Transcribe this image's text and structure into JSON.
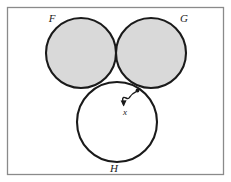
{
  "figure": {
    "background_color": "#ffffff",
    "frame": {
      "name": "diagram-frame",
      "x": 7.5,
      "y": 7.5,
      "width": 216,
      "height": 167,
      "stroke_color": "#8a8a8a",
      "stroke_width": 1.3,
      "fill": "#ffffff"
    },
    "shading": {
      "description": "Union of F and G, excluding H",
      "fill_color": "#d9d9d9"
    },
    "circle_stroke_color": "#1a1a1a",
    "circle_stroke_width": 2.1
  },
  "circles": [
    {
      "name": "circle-f",
      "label": "F",
      "cx": 81,
      "cy": 53,
      "r": 35,
      "shaded": true,
      "label_x": 52,
      "label_y": 22
    },
    {
      "name": "circle-g",
      "label": "G",
      "cx": 151,
      "cy": 53,
      "r": 35,
      "shaded": true,
      "label_x": 184,
      "label_y": 22
    },
    {
      "name": "circle-h",
      "label": "H",
      "cx": 117,
      "cy": 122,
      "r": 40,
      "shaded": false,
      "label_x": 114,
      "label_y": 172
    }
  ],
  "annotation": {
    "name": "element-x-annotation",
    "label": "x",
    "point": {
      "x": 137.5,
      "y": 90.5,
      "radius": 1.9
    },
    "label_position": {
      "x": 125,
      "y": 115
    },
    "arrow_tip": {
      "x": 123.5,
      "y": 105.5
    },
    "arrow_path": "M 136.2 91.6 C 127.5 95.5 131.0 100.5 126.0 98.0 C 121.5 95.8 122.5 100.0 123.6 105.0",
    "arrow_stroke_color": "#1a1a1a",
    "arrow_stroke_width": 1.4
  }
}
